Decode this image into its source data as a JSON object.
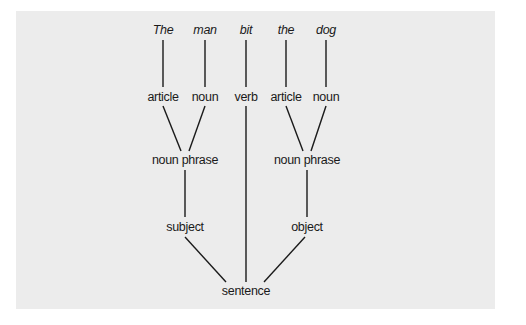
{
  "diagram": {
    "title": "",
    "background_color": "#ececec",
    "line_color": "#1a1a1a",
    "words": [
      {
        "text": "The",
        "x": 163
      },
      {
        "text": "man",
        "x": 205
      },
      {
        "text": "bit",
        "x": 246
      },
      {
        "text": "the",
        "x": 286
      },
      {
        "text": "dog",
        "x": 326
      }
    ],
    "parts_of_speech": [
      {
        "text": "article",
        "x": 163
      },
      {
        "text": "noun",
        "x": 205
      },
      {
        "text": "verb",
        "x": 246
      },
      {
        "text": "article",
        "x": 286
      },
      {
        "text": "noun",
        "x": 326
      }
    ],
    "phrases": [
      {
        "text": "noun phrase",
        "x": 185
      },
      {
        "text": "noun phrase",
        "x": 307
      }
    ],
    "roles": [
      {
        "text": "subject",
        "x": 185
      },
      {
        "text": "object",
        "x": 307
      }
    ],
    "root": {
      "text": "sentence",
      "x": 246
    }
  }
}
